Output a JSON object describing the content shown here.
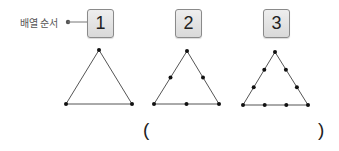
{
  "legend": {
    "label": "배열 순서"
  },
  "sequence": [
    {
      "number": "1",
      "points_per_side": 2,
      "total_points": 3
    },
    {
      "number": "2",
      "points_per_side": 3,
      "total_points": 6
    },
    {
      "number": "3",
      "points_per_side": 4,
      "total_points": 9
    }
  ],
  "answer": {
    "open_paren": "(",
    "close_paren": ")",
    "value": ""
  },
  "colors": {
    "line": "#555555",
    "dot": "#111111",
    "box_border": "#8a8a8a",
    "box_fill": "#e3e3e3"
  }
}
